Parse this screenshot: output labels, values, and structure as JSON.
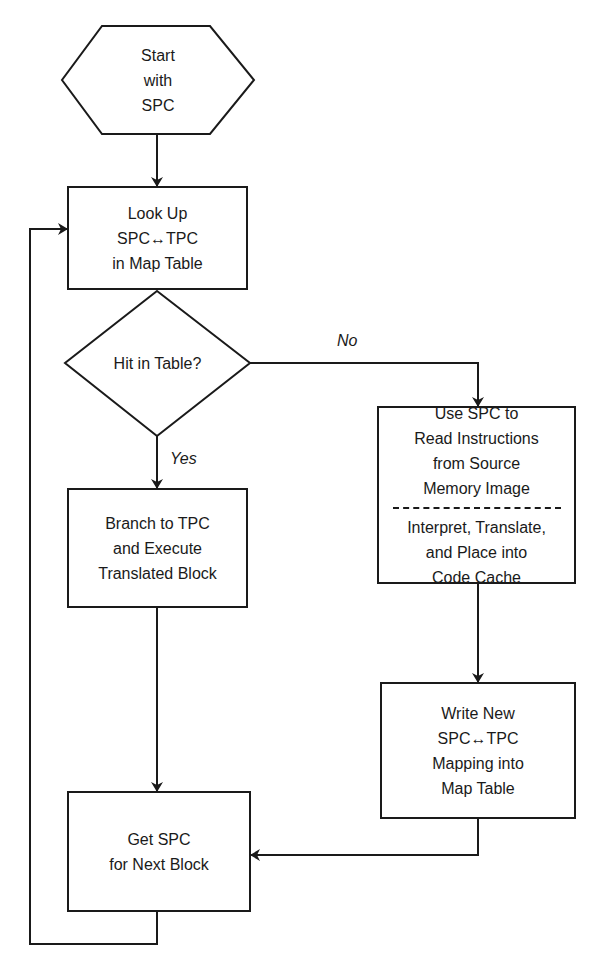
{
  "diagram": {
    "type": "flowchart",
    "nodes": {
      "start": {
        "shape": "hexagon",
        "lines": [
          "Start",
          "with",
          "SPC"
        ]
      },
      "lookup": {
        "shape": "rectangle",
        "lines": [
          "Look Up",
          "SPC↔TPC",
          "in Map Table"
        ]
      },
      "decision": {
        "shape": "diamond",
        "lines": [
          "Hit in Table?"
        ]
      },
      "branch": {
        "shape": "rectangle",
        "lines": [
          "Branch to TPC",
          "and Execute",
          "Translated Block"
        ]
      },
      "translate": {
        "shape": "rectangle",
        "top_lines": [
          "Use SPC to",
          "Read Instructions",
          "from Source",
          "Memory Image"
        ],
        "bottom_lines": [
          "Interpret, Translate,",
          "and Place into",
          "Code Cache"
        ]
      },
      "write_map": {
        "shape": "rectangle",
        "lines": [
          "Write New",
          "SPC↔TPC",
          "Mapping into",
          "Map Table"
        ]
      },
      "next": {
        "shape": "rectangle",
        "lines": [
          "Get SPC",
          "for Next Block"
        ]
      }
    },
    "edges": {
      "yes_label": "Yes",
      "no_label": "No"
    },
    "colors": {
      "stroke": "#1a1a1a",
      "background": "#ffffff"
    }
  }
}
